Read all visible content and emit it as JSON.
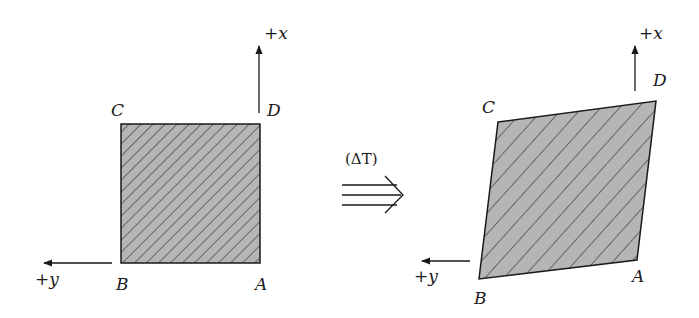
{
  "diagram": {
    "type": "deformation-diagram",
    "colors": {
      "fill": "#b5b5b5",
      "hatch": "#3a3a3a",
      "stroke": "#1a1a1a",
      "background": "#ffffff"
    },
    "before": {
      "axis_x_label": "+x",
      "axis_y_label": "+y",
      "corners": {
        "A": "A",
        "B": "B",
        "C": "C",
        "D": "D"
      }
    },
    "transition": {
      "label": "(ΔT)",
      "arrow": "triple-arrow-right"
    },
    "after": {
      "axis_x_label": "+x",
      "axis_y_label": "+y",
      "corners": {
        "A": "A",
        "B": "B",
        "C": "C",
        "D": "D"
      }
    }
  }
}
